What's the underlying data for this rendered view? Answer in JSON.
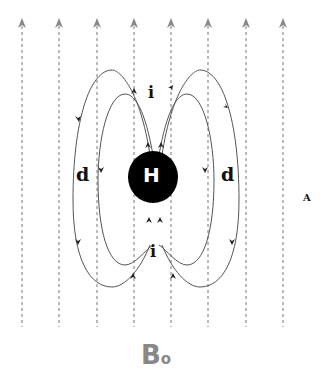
{
  "diagram": {
    "field_lines_x": [
      22,
      59,
      97,
      134,
      171,
      208,
      246,
      283
    ],
    "field_line_top": 22,
    "field_line_bottom": 327,
    "center_label": "H",
    "labels": {
      "i_top": "i",
      "i_bottom": "i",
      "d_left": "d",
      "d_right": "d",
      "A": "A",
      "B": "B",
      "B_sub": "o"
    },
    "colors": {
      "field_line": "#777777",
      "loop": "#444444",
      "nucleus": "#000000"
    }
  }
}
